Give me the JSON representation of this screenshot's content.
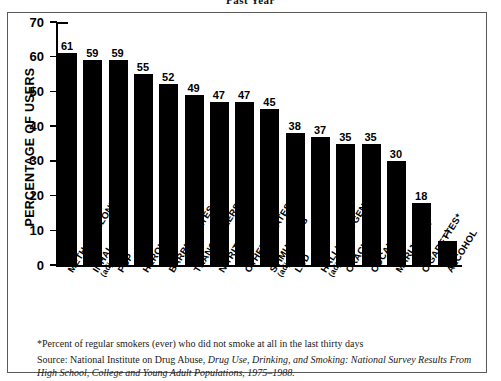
{
  "title": "Past Year",
  "frame": {
    "border_color": "#5a5a5a"
  },
  "footnote": "*Percent of regular smokers (ever) who did not smoke at all in the last thirty days",
  "source": {
    "prefix": "Source: National Institute on Drug Abuse, ",
    "italic1": "Drug Use, Drinking, and Smoking: National Survey Results",
    "italic2": "From High School, College and Young Adult Populations, 1975–1988."
  },
  "chart_data": {
    "type": "bar",
    "title": "Past Year",
    "xlabel": "",
    "ylabel": "PERCENTAGE OF USERS",
    "ylim": [
      0,
      70
    ],
    "yticks": [
      0,
      10,
      20,
      30,
      40,
      50,
      60,
      70
    ],
    "grid": false,
    "legend": "none",
    "bar_color": "#000000",
    "categories": [
      "METHAQUALONE",
      "INHALANTS",
      "PCP",
      "HEROIN",
      "BARBITURATES",
      "TRANQUILIZERS",
      "NITRITES",
      "OTHER OPIATES",
      "STIMULANTS",
      "LSD",
      "HALLUCINOGENS",
      "CRACK",
      "COCAINE",
      "MARIJUANA",
      "CIGARETTES*",
      "ALCOHOL"
    ],
    "category_sublabels": [
      "",
      "(adjusted)",
      "",
      "",
      "",
      "",
      "",
      "",
      "(adjusted)",
      "",
      "(adjusted)",
      "",
      "",
      "",
      "",
      ""
    ],
    "values": [
      61,
      59,
      59,
      55,
      52,
      49,
      47,
      47,
      45,
      38,
      37,
      35,
      35,
      30,
      18,
      7
    ]
  }
}
